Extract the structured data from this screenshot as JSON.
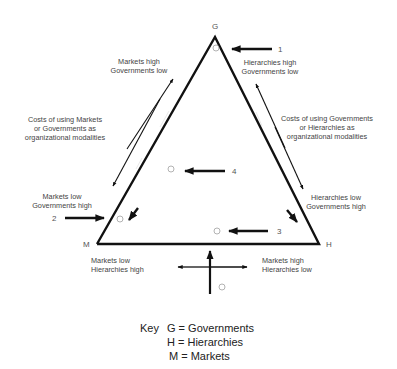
{
  "vertices": {
    "g": "G",
    "h": "H",
    "m": "M"
  },
  "points": {
    "p1": "1",
    "p2": "2",
    "p3": "3",
    "p4": "4"
  },
  "labels": {
    "markets_high_gov_low": [
      "Markets high",
      "Governments low"
    ],
    "hier_high_gov_low": [
      "Hierarchies high",
      "Governments low"
    ],
    "costs_markets_gov": [
      "Costs of using Markets",
      "or Governments as",
      "organizational modalities"
    ],
    "costs_gov_hier": [
      "Costs of using Governments",
      "or Hierarchies as",
      "organizational modalities"
    ],
    "markets_low_gov_high": [
      "Markets low",
      "Governments high"
    ],
    "hier_low_gov_high": [
      "Hierarchies low",
      "Governments high"
    ],
    "markets_low_hier_high": [
      "Markets low",
      "Hierarchies high"
    ],
    "markets_high_hier_low": [
      "Markets high",
      "Hierarchies low"
    ]
  },
  "key": {
    "title": "Key",
    "entries": [
      "G = Governments",
      "H = Hierarchies",
      "M = Markets"
    ]
  }
}
